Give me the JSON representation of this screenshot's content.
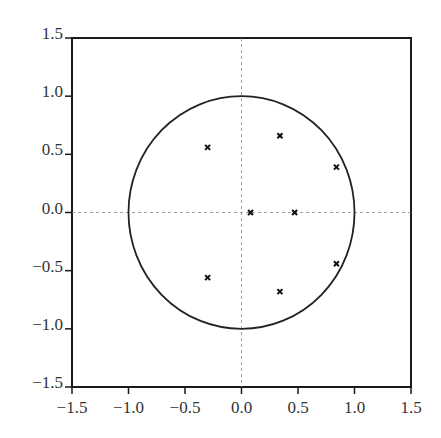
{
  "chart_data": {
    "type": "scatter",
    "title": "",
    "xlabel": "",
    "ylabel": "",
    "xlim": [
      -1.5,
      1.5
    ],
    "ylim": [
      -1.5,
      1.5
    ],
    "grid": false,
    "reference_lines": {
      "x": 0,
      "y": 0,
      "style": "dashed"
    },
    "unit_circle": {
      "center": [
        0,
        0
      ],
      "radius": 1
    },
    "x_ticks": [
      "-1.5",
      "-1.0",
      "-0.5",
      "0.0",
      "0.5",
      "1.0",
      "1.5"
    ],
    "y_ticks": [
      "1.5",
      "1.0",
      "0.5",
      "0.0",
      "-0.5",
      "-1.0",
      "-1.5"
    ],
    "x_tick_values": [
      -1.5,
      -1.0,
      -0.5,
      0.0,
      0.5,
      1.0,
      1.5
    ],
    "y_tick_values": [
      1.5,
      1.0,
      0.5,
      0.0,
      -0.5,
      -1.0,
      -1.5
    ],
    "marker": "x",
    "points": [
      {
        "x": -0.3,
        "y": 0.56
      },
      {
        "x": -0.3,
        "y": -0.56
      },
      {
        "x": 0.34,
        "y": 0.66
      },
      {
        "x": 0.34,
        "y": -0.68
      },
      {
        "x": 0.84,
        "y": 0.39
      },
      {
        "x": 0.84,
        "y": -0.44
      },
      {
        "x": 0.08,
        "y": 0.0
      },
      {
        "x": 0.47,
        "y": 0.0
      }
    ],
    "legend": []
  },
  "colors": {
    "axis": "#1a1a1a",
    "circle": "#222222",
    "reference": "#888888",
    "marker": "#111111",
    "text": "#333333"
  }
}
